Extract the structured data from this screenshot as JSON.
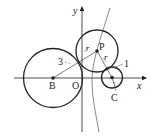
{
  "diagram": {
    "axes": {
      "x_label": "x",
      "y_label": "y",
      "origin_label": "O"
    },
    "points": {
      "B": {
        "label": "B"
      },
      "P": {
        "label": "P"
      },
      "C": {
        "label": "C"
      }
    },
    "circles": [
      {
        "center": "B",
        "radius_label": "3"
      },
      {
        "center": "P",
        "radius_label": "r"
      },
      {
        "center": "C",
        "radius_label": "1"
      }
    ],
    "segment_labels": {
      "BP_radius": "3",
      "PB_r": "r",
      "PC_r": "r",
      "C_radius": "1"
    },
    "colors": {
      "stroke": "#222222",
      "curve": "#555555",
      "background": "#ffffff"
    }
  }
}
